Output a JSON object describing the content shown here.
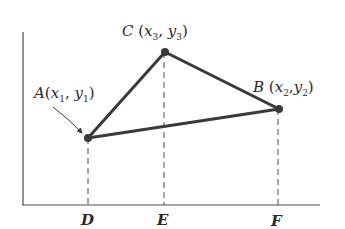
{
  "diagram": {
    "type": "coordinate-triangle",
    "axes": {
      "x_axis": {
        "x1": 22,
        "y1": 205,
        "x2": 320,
        "y2": 205
      },
      "y_axis": {
        "x1": 23,
        "y1": 32,
        "x2": 23,
        "y2": 205
      }
    },
    "points": [
      {
        "id": "A",
        "name": "A",
        "x_sym": "x",
        "x_sub": "1",
        "y_sym": "y",
        "y_sub": "1",
        "px": 88,
        "py": 138
      },
      {
        "id": "B",
        "name": "B",
        "x_sym": "x",
        "x_sub": "2",
        "y_sym": "y",
        "y_sub": "2",
        "px": 279,
        "py": 109
      },
      {
        "id": "C",
        "name": "C",
        "x_sym": "x",
        "x_sub": "3",
        "y_sym": "y",
        "y_sub": "3",
        "px": 165,
        "py": 52
      }
    ],
    "feet": [
      {
        "label": "D",
        "from": "A"
      },
      {
        "label": "E",
        "from": "C"
      },
      {
        "label": "F",
        "from": "B"
      }
    ],
    "colors": {
      "line": "#3a3a3a",
      "axis": "#4a4a4a",
      "text": "#2a2a2a"
    }
  }
}
